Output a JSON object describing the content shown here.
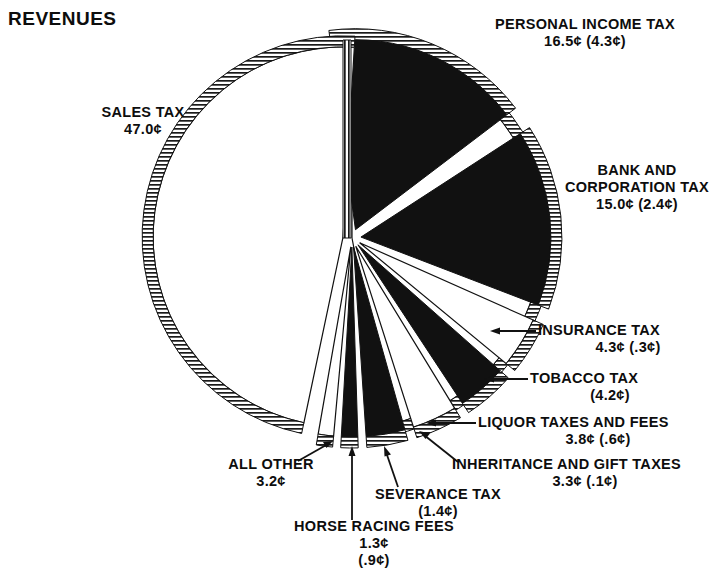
{
  "header": {
    "title": "REVENUES"
  },
  "chart_data": {
    "type": "pie",
    "title": "REVENUES",
    "units": "cents per dollar",
    "center": [
      352,
      238
    ],
    "radius": 190,
    "grid": false,
    "legend_position": "callout-labels",
    "categories": [
      "SALES TAX",
      "PERSONAL INCOME TAX",
      "BANK AND CORPORATION TAX",
      "INSURANCE TAX",
      "TOBACCO TAX",
      "LIQUOR TAXES AND FEES",
      "INHERITANCE AND GIFT TAXES",
      "SEVERANCE TAX",
      "HORSE RACING FEES",
      "ALL OTHER"
    ],
    "values": [
      47.0,
      16.5,
      15.0,
      4.3,
      4.2,
      3.8,
      3.3,
      1.4,
      1.3,
      3.2
    ],
    "secondary_values": [
      null,
      4.3,
      2.4,
      0.3,
      null,
      0.6,
      0.1,
      null,
      0.9,
      null
    ],
    "slices": [
      {
        "name": "SALES TAX",
        "value": "47.0¢",
        "value2": "",
        "fill": "white",
        "exploded": false,
        "start": 0,
        "end": 169.2
      },
      {
        "name": "PERSONAL INCOME TAX",
        "value": "16.5¢",
        "value2": "(4.3¢)",
        "fill": "black",
        "exploded": true,
        "start": 352.4,
        "end": 412.8
      },
      {
        "name": "BANK AND CORPORATION TAX",
        "value": "15.0¢",
        "value2": "(2.4¢)",
        "fill": "black",
        "exploded": true,
        "start": 417.0,
        "end": 471.0
      },
      {
        "name": "INSURANCE TAX",
        "value": "4.3¢",
        "value2": "(.3¢)",
        "fill": "white",
        "exploded": true,
        "start": 474.0,
        "end": 489.5
      },
      {
        "name": "TOBACCO TAX",
        "value": "",
        "value2": "(4.2¢)",
        "fill": "black",
        "exploded": true,
        "start": 491.5,
        "end": 506.6
      },
      {
        "name": "LIQUOR TAXES AND FEES",
        "value": "3.8¢",
        "value2": "(.6¢)",
        "fill": "white",
        "exploded": true,
        "start": 508.6,
        "end": 522.3
      },
      {
        "name": "INHERITANCE AND GIFT TAXES",
        "value": "3.3¢",
        "value2": "(.1¢)",
        "fill": "black",
        "exploded": true,
        "start": 524.3,
        "end": 536.2
      },
      {
        "name": "SEVERANCE TAX",
        "value": "",
        "value2": "(1.4¢)",
        "fill": "black",
        "exploded": true,
        "start": 538.2,
        "end": 543.2
      },
      {
        "name": "HORSE RACING FEES",
        "value": "1.3¢",
        "value2": "(.9¢)",
        "fill": "white",
        "exploded": true,
        "start": 545.2,
        "end": 549.9
      },
      {
        "name": "ALL OTHER",
        "value": "3.2¢",
        "value2": "",
        "fill": "white",
        "exploded": true,
        "start": 551.9,
        "end": 363.4
      }
    ]
  },
  "labels": {
    "sales": {
      "l1": "SALES TAX",
      "l2": "47.0¢",
      "l3": ""
    },
    "personal": {
      "l1": "PERSONAL INCOME TAX",
      "l2": "16.5¢ (4.3¢)",
      "l3": ""
    },
    "bank": {
      "l1": "BANK AND",
      "l2": "CORPORATION TAX",
      "l3": "15.0¢ (2.4¢)"
    },
    "insurance": {
      "l1": "INSURANCE TAX",
      "l2": "4.3¢ (.3¢)",
      "l3": ""
    },
    "tobacco": {
      "l1": "TOBACCO TAX",
      "l2": "(4.2¢)",
      "l3": ""
    },
    "liquor": {
      "l1": "LIQUOR TAXES AND FEES",
      "l2": "3.8¢ (.6¢)",
      "l3": ""
    },
    "inherit": {
      "l1": "INHERITANCE AND GIFT TAXES",
      "l2": "3.3¢ (.1¢)",
      "l3": ""
    },
    "severance": {
      "l1": "SEVERANCE TAX",
      "l2": "(1.4¢)",
      "l3": ""
    },
    "horse": {
      "l1": "HORSE RACING FEES",
      "l2": "1.3¢",
      "l3": "(.9¢)"
    },
    "allother": {
      "l1": "ALL OTHER",
      "l2": "3.2¢",
      "l3": ""
    }
  },
  "colors": {
    "ink": "#111111",
    "paper": "#ffffff",
    "slice_dark": "#111111",
    "slice_light": "#ffffff"
  }
}
